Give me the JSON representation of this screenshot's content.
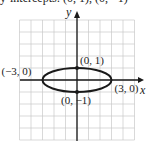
{
  "header": {
    "cutoff_text": "y-intercepts: (0, 1), (0, −1)"
  },
  "chart_data": {
    "type": "scatter",
    "title": "",
    "xlabel": "x",
    "ylabel": "y",
    "xlim": [
      -5,
      5
    ],
    "ylim": [
      -5,
      5
    ],
    "grid": true,
    "curve": {
      "shape": "ellipse",
      "center": [
        0,
        0
      ],
      "semi_axis_x": 3,
      "semi_axis_y": 1,
      "equation": "x^2/9 + y^2 = 1"
    },
    "points": [
      {
        "x": 0,
        "y": 1,
        "label": "(0, 1)"
      },
      {
        "x": 0,
        "y": -1,
        "label": "(0, −1)"
      },
      {
        "x": -3,
        "y": 0,
        "label": "(−3, 0)"
      },
      {
        "x": 3,
        "y": 0,
        "label": "(3, 0)"
      }
    ]
  },
  "colors": {
    "grid": "#c8c8c8",
    "axis": "#1a1a1a",
    "curve": "#1a1a1a"
  }
}
